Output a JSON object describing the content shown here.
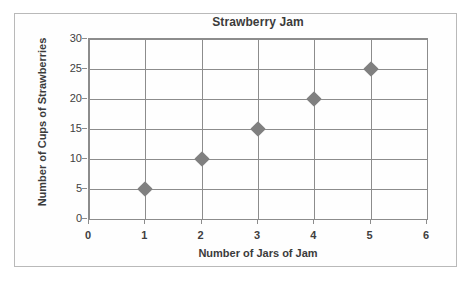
{
  "chart_data": {
    "type": "scatter",
    "title": "Strawberry Jam",
    "xlabel": "Number of Jars of Jam",
    "ylabel": "Number of Cups of Strawberries",
    "x": [
      1,
      2,
      3,
      4,
      5
    ],
    "values": [
      5,
      10,
      15,
      20,
      25
    ],
    "points": [
      {
        "x": 1,
        "y": 5
      },
      {
        "x": 2,
        "y": 10
      },
      {
        "x": 3,
        "y": 15
      },
      {
        "x": 4,
        "y": 20
      },
      {
        "x": 5,
        "y": 25
      }
    ],
    "xlim": [
      0,
      6
    ],
    "ylim": [
      0,
      30
    ],
    "xticks": [
      "0",
      "1",
      "2",
      "3",
      "4",
      "5",
      "6"
    ],
    "yticks": [
      "0",
      "5",
      "10",
      "15",
      "20",
      "25",
      "30"
    ],
    "xtick_values": [
      0,
      1,
      2,
      3,
      4,
      5,
      6
    ],
    "ytick_values": [
      0,
      5,
      10,
      15,
      20,
      25,
      30
    ],
    "grid": "both",
    "legend": "none",
    "marker_shape": "diamond",
    "marker_color": "#808080",
    "axis_color": "#8c8c8c",
    "text_color": "#3b3b3b",
    "plot_background": "#ffffff"
  }
}
